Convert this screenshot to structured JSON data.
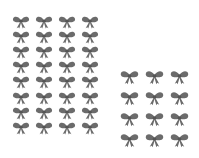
{
  "image": {
    "background": "#ffffff",
    "bow_color": "#6b6b6b",
    "description": "Two groups of gray ribbon bow stickers"
  },
  "groups": [
    {
      "name": "left-sheet",
      "columns": 4,
      "rows": 8,
      "count": 32
    },
    {
      "name": "right-sheet",
      "columns": 3,
      "rows": 4,
      "count": 12
    }
  ]
}
